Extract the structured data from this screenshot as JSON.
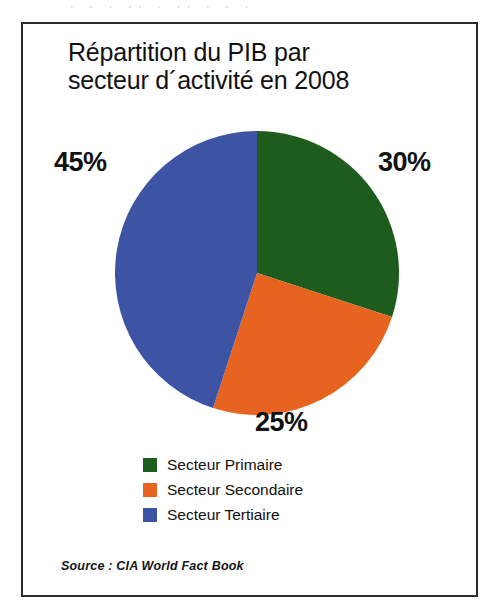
{
  "scan_artifact": {
    "text": "·  ·    ·  ·· ·   ·· · ·  ·"
  },
  "figure": {
    "title": "Répartition du PIB par\nsecteur d´activité en 2008",
    "source": "Source : CIA World Fact Book"
  },
  "labels": {
    "primaire_pct": "30%",
    "secondaire_pct": "25%",
    "tertiaire_pct": "45%"
  },
  "legend": {
    "items": [
      {
        "label": "Secteur Primaire",
        "color": "#1d5c1c"
      },
      {
        "label": "Secteur Secondaire",
        "color": "#e6641f"
      },
      {
        "label": "Secteur Tertiaire",
        "color": "#3d53a4"
      }
    ]
  },
  "chart_data": {
    "type": "pie",
    "title": "Répartition du PIB par secteur d´activité en 2008",
    "subtitle": "",
    "xlabel": "",
    "ylabel": "",
    "unit": "%",
    "start_angle_deg": 0,
    "direction": "clockwise",
    "legend_position": "bottom-left",
    "grid": false,
    "categories": [
      "Secteur Primaire",
      "Secteur Secondaire",
      "Secteur Tertiaire"
    ],
    "values": [
      30,
      25,
      45
    ],
    "data_labels": [
      "30%",
      "25%",
      "45%"
    ],
    "colors": [
      "#1d5c1c",
      "#e6641f",
      "#3d53a4"
    ],
    "slices": [
      {
        "name": "Secteur Primaire",
        "value": 30,
        "label": "30%",
        "color": "#1d5c1c",
        "start_deg": 0,
        "end_deg": 108
      },
      {
        "name": "Secteur Secondaire",
        "value": 25,
        "label": "25%",
        "color": "#e6641f",
        "start_deg": 108,
        "end_deg": 198
      },
      {
        "name": "Secteur Tertiaire",
        "value": 45,
        "label": "45%",
        "color": "#3d53a4",
        "start_deg": 198,
        "end_deg": 360
      }
    ],
    "total": 100,
    "annotations": [
      "Source : CIA World Fact Book"
    ]
  }
}
